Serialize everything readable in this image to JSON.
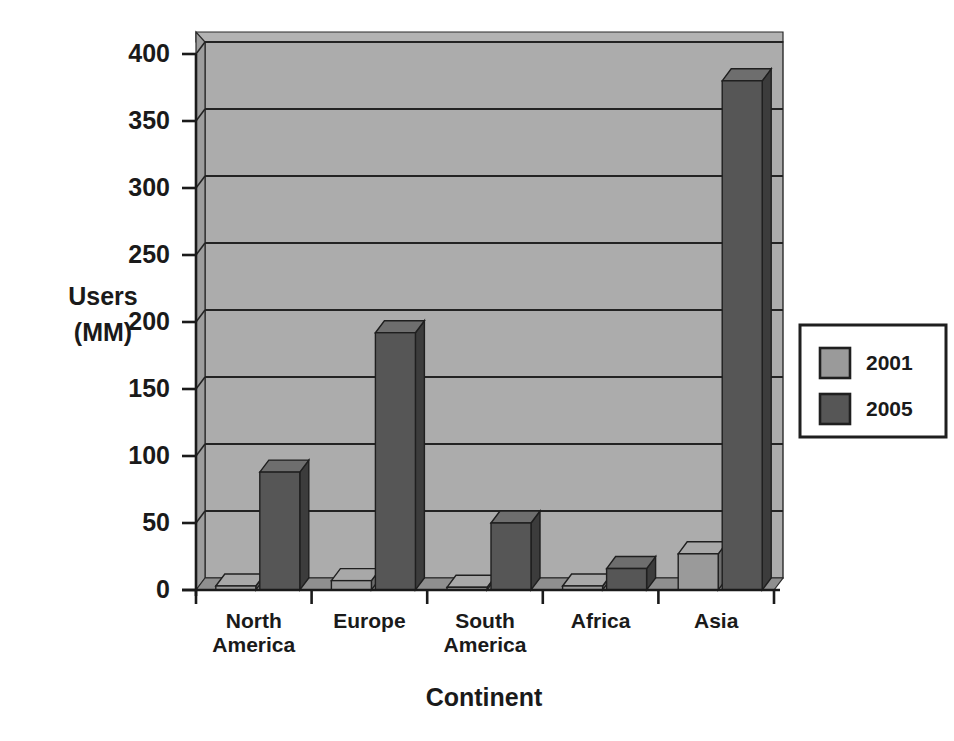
{
  "chart_data": {
    "type": "bar",
    "title": "",
    "subtitle": "",
    "xlabel": "Continent",
    "ylabel": "Users (MM)",
    "ylabel_line1": "Users",
    "ylabel_line2": "(MM)",
    "categories": [
      "North America",
      "Europe",
      "South America",
      "Africa",
      "Asia"
    ],
    "category_lines": [
      [
        "North",
        "America"
      ],
      [
        "Europe"
      ],
      [
        "South",
        "America"
      ],
      [
        "Africa"
      ],
      [
        "Asia"
      ]
    ],
    "series": [
      {
        "name": "2001",
        "color": "#9a9a9a",
        "values": [
          3,
          7,
          2,
          3,
          27
        ]
      },
      {
        "name": "2005",
        "color": "#565656",
        "values": [
          88,
          192,
          50,
          16,
          380
        ]
      }
    ],
    "ylim": [
      0,
      400
    ],
    "yticks": [
      0,
      50,
      100,
      150,
      200,
      250,
      300,
      350,
      400
    ],
    "ytick_labels": [
      "0",
      "50",
      "100",
      "150",
      "200",
      "250",
      "300",
      "350",
      "400"
    ],
    "grid": true,
    "grid_axis": "y",
    "legend_position": "right",
    "legend_entries": [
      {
        "label": "2001",
        "color": "#9a9a9a"
      },
      {
        "label": "2005",
        "color": "#565656"
      }
    ],
    "style": "3d-bars",
    "plot_background": "#aaaaaa",
    "plot_wall_color": "#a8a8a8",
    "plot_floor_color": "#8e8e8e",
    "axis_color": "#1a1a1a"
  },
  "figure": {
    "background": "#ffffff",
    "y_axis_title_line1": "Users",
    "y_axis_title_line2": "(MM)",
    "x_axis_title": "Continent"
  }
}
